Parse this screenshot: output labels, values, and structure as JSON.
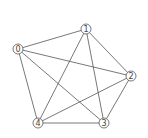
{
  "graph": {
    "type": "complete-graph",
    "nodes": [
      {
        "id": "0",
        "label": "0",
        "x": 18,
        "y": 49
      },
      {
        "id": "1",
        "label": "1",
        "x": 86,
        "y": 29
      },
      {
        "id": "2",
        "label": "2",
        "x": 131,
        "y": 76
      },
      {
        "id": "3",
        "label": "3",
        "x": 104,
        "y": 123
      },
      {
        "id": "4",
        "label": "4",
        "x": 38,
        "y": 123
      }
    ],
    "edges": [
      [
        "0",
        "1"
      ],
      [
        "0",
        "2"
      ],
      [
        "0",
        "3"
      ],
      [
        "0",
        "4"
      ],
      [
        "1",
        "2"
      ],
      [
        "1",
        "3"
      ],
      [
        "1",
        "4"
      ],
      [
        "2",
        "3"
      ],
      [
        "2",
        "4"
      ],
      [
        "3",
        "4"
      ]
    ]
  }
}
